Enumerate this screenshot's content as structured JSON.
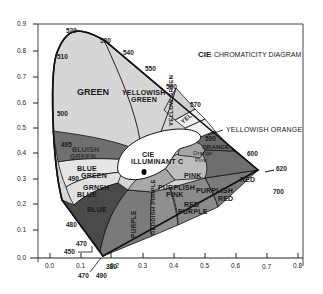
{
  "title": {
    "prefix": "CIE",
    "rest": "CHROMATICITY DIAGRAM"
  },
  "axes": {
    "x_ticks": [
      "0.0",
      "0.1",
      "0.2",
      "0.3",
      "0.4",
      "0.5",
      "0.6",
      "0.7",
      "0.8"
    ],
    "y_ticks": [
      "0.9",
      "0.8",
      "0.7",
      "0.6",
      "0.5",
      "0.4",
      "0.3",
      "0.2",
      "0.1",
      "0.0"
    ]
  },
  "wavelengths": {
    "w520": "520",
    "w530": "530",
    "w540": "540",
    "w550": "550",
    "w560": "560",
    "w570": "570",
    "w580": "580",
    "w590": "590",
    "w600": "600",
    "w620": "620",
    "w700": "700",
    "w510": "510",
    "w500": "500",
    "w495": "495",
    "w490": "490",
    "w480": "480",
    "w470": "470",
    "w450": "450",
    "w470b": "470",
    "w490b": "490",
    "w380": "380"
  },
  "regions": {
    "green": "GREEN",
    "yellowish_green_1": "YELLOWISH",
    "yellowish_green_2": "GREEN",
    "yellow_green": "YELLOW GREEN",
    "yellow": "YEL",
    "yellowish_orange": "YELLOWISH ORANGE",
    "orange": "ORANGE",
    "orange_pink_1": "Orange",
    "orange_pink_2": "Pink",
    "pink": "PINK",
    "red": "RED",
    "purplish_red_1": "PURPLISH",
    "purplish_red_2": "RED",
    "purplish_pink_1": "PURPLISH",
    "purplish_pink_2": "PINK",
    "red_purple_1": "RED",
    "red_purple_2": "PURPLE",
    "reddish_purple": "REDDISH PURPLE",
    "purple": "PURPLE",
    "blue": "BLUE",
    "greenish_blue_1": "GRNSH",
    "greenish_blue_2": "BLUE",
    "blue_green_1": "BLUE",
    "blue_green_2": "GREEN",
    "bluish_green_1": "BLUISH",
    "bluish_green_2": "GREEN",
    "illuminant_1": "CIE",
    "illuminant_2": "ILLUMINANT C"
  },
  "colors": {
    "light": "#d9d9d9",
    "mid": "#b5b5b5",
    "dark": "#8f8f8f",
    "darker": "#6e6e6e",
    "darkest": "#4a4a4a",
    "white": "#ffffff",
    "line": "#111111"
  }
}
